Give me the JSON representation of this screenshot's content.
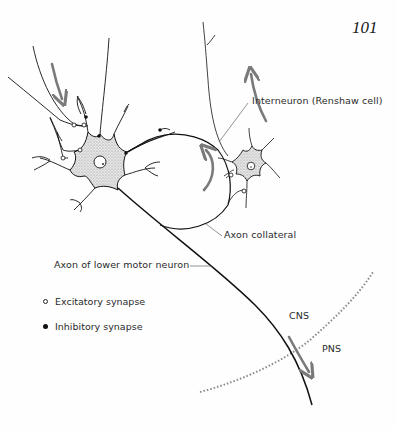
{
  "page": {
    "number": "101"
  },
  "figure": {
    "labels": {
      "interneuron": "Interneuron (Renshaw cell)",
      "axon_collateral": "Axon collateral",
      "axon_motor": "Axon of lower motor neuron",
      "cns": "CNS",
      "pns": "PNS"
    },
    "legend": [
      {
        "marker": "open-circle",
        "label": "Excitatory synapse"
      },
      {
        "marker": "filled-circle",
        "label": "Inhibitory synapse"
      }
    ],
    "colors": {
      "line": "#111111",
      "arrow": "#7a7a7a",
      "soma_fill": "#d8d8d8",
      "boundary": "#8a8a8a",
      "leader": "#666666"
    }
  }
}
